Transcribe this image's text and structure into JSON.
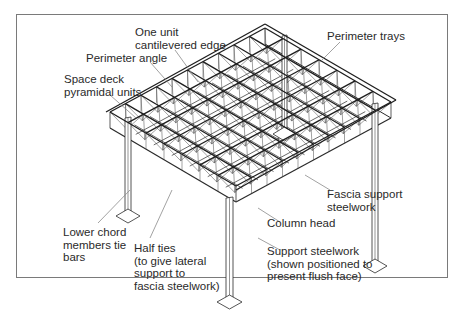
{
  "figure": {
    "type": "isometric structural diagram",
    "colors": {
      "line": "#2a2a2a",
      "leader": "#8a8a8a",
      "frame": "#7a7a7a",
      "background": "#ffffff"
    }
  },
  "labels": {
    "one_unit_cantilevered_edge": "One unit\ncantilevered edge",
    "perimeter_angle": "Perimeter angle",
    "space_deck_pyramidal_units": "Space deck\npyramidal units",
    "perimeter_trays": "Perimeter trays",
    "fascia_support_steelwork": "Fascia support\nsteelwork",
    "column_head": "Column head",
    "lower_chord_members_tie_bars": "Lower chord\nmembers tie\nbars",
    "half_ties": "Half ties\n(to give lateral\nsupport to\nfascia steelwork)",
    "support_steelwork": "Support steelwork\n(shown positioned to\npresent flush face)"
  }
}
